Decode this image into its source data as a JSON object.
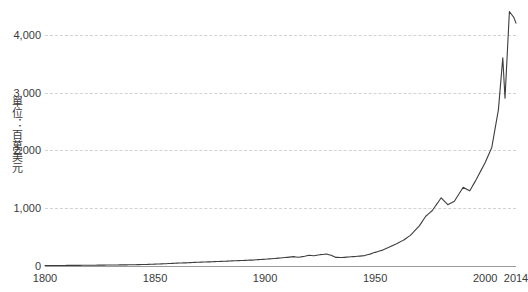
{
  "chart_data": {
    "type": "line",
    "title": "",
    "subtitle": "",
    "xlabel": "",
    "ylabel": "單位：百萬美元",
    "xlim": [
      1800,
      2014
    ],
    "ylim": [
      0,
      4600
    ],
    "y_ticks": [
      0,
      1000,
      2000,
      3000,
      4000
    ],
    "y_tick_labels": [
      "0",
      "1,000",
      "2,000",
      "3,000",
      "4,000"
    ],
    "x_ticks": [
      1800,
      1850,
      1900,
      1950,
      2000,
      2014
    ],
    "x_tick_labels": [
      "1800",
      "1850",
      "1900",
      "1950",
      "2000",
      "2014"
    ],
    "grid": "horizontal-dashed",
    "legend": "none",
    "line_color": "#3d3d3d",
    "grid_color": "#d2d2d2",
    "axis_color": "#9a9a9a",
    "note": "Curve exceeds the top of the visible plot after 2008; peak values are clipped by the image crop.",
    "series": [
      {
        "name": "值",
        "x": [
          1800,
          1805,
          1810,
          1815,
          1820,
          1825,
          1830,
          1835,
          1840,
          1845,
          1850,
          1855,
          1860,
          1865,
          1870,
          1875,
          1880,
          1885,
          1890,
          1895,
          1900,
          1905,
          1910,
          1913,
          1915,
          1918,
          1920,
          1922,
          1925,
          1928,
          1930,
          1932,
          1935,
          1938,
          1940,
          1945,
          1948,
          1950,
          1953,
          1956,
          1960,
          1963,
          1966,
          1970,
          1973,
          1976,
          1980,
          1983,
          1986,
          1990,
          1993,
          1996,
          2000,
          2003,
          2006,
          2008,
          2009,
          2011,
          2013,
          2014
        ],
        "values": [
          8,
          9,
          10,
          11,
          13,
          15,
          17,
          19,
          22,
          26,
          32,
          40,
          50,
          56,
          66,
          72,
          80,
          88,
          96,
          104,
          118,
          132,
          150,
          162,
          150,
          168,
          186,
          176,
          196,
          206,
          186,
          150,
          146,
          156,
          162,
          178,
          210,
          236,
          270,
          320,
          390,
          450,
          530,
          690,
          860,
          960,
          1180,
          1060,
          1120,
          1360,
          1300,
          1500,
          1790,
          2050,
          2700,
          3600,
          2900,
          4400,
          4300,
          4200
        ]
      }
    ]
  },
  "axes": {
    "y_title": "單位：百萬美元"
  }
}
